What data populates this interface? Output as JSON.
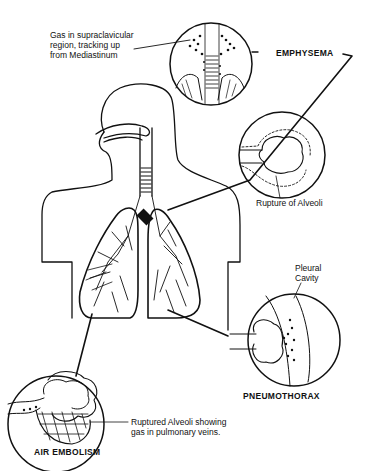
{
  "diagram": {
    "colors": {
      "ink": "#111111",
      "background": "#ffffff"
    },
    "callouts": [
      {
        "id": "emphysema",
        "title": "EMPHYSEMA",
        "note": "Gas in supraclavicular\nregion, tracking up\nfrom Mediastinum"
      },
      {
        "id": "alveoli",
        "title": "",
        "note": "Rupture of Alveoli"
      },
      {
        "id": "pneumothorax",
        "title": "PNEUMOTHORAX",
        "note": "Pleural\nCavity"
      },
      {
        "id": "air-embolism",
        "title": "AIR EMBOLISM",
        "note": "Ruptured Alveoli showing\ngas in pulmonary veins."
      }
    ]
  }
}
